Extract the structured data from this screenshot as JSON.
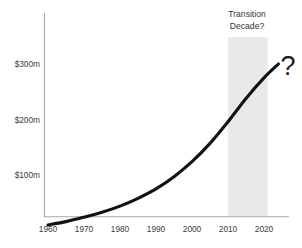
{
  "chart_data": {
    "type": "line",
    "title": "",
    "subtitle": "",
    "xlabel": "",
    "ylabel": "",
    "grid": false,
    "legend": "none",
    "x": [
      1960,
      1965,
      1970,
      1975,
      1980,
      1985,
      1990,
      1995,
      2000,
      2005,
      2010,
      2015,
      2020,
      2024
    ],
    "xlim": [
      1960,
      2025
    ],
    "ylim": [
      0,
      340
    ],
    "xticks": [
      "1960",
      "1970",
      "1980",
      "1990",
      "2000",
      "2010",
      "2020"
    ],
    "xtick_values": [
      1960,
      1970,
      1980,
      1990,
      2000,
      2010,
      2020
    ],
    "yticks": [
      "$100m",
      "$200m",
      "$300m"
    ],
    "ytick_values": [
      100,
      200,
      300
    ],
    "series": [
      {
        "name": "",
        "color": "#111111",
        "values": [
          10,
          16,
          24,
          33,
          44,
          58,
          75,
          97,
          124,
          157,
          196,
          238,
          275,
          300
        ]
      }
    ],
    "annotations": [
      {
        "name": "transition-decade",
        "line1": "Transition",
        "line2": "Decade?",
        "span_start": 2010,
        "span_end": 2021,
        "band_color": "#e9e9e9"
      },
      {
        "name": "uncertainty-marker",
        "text": "?",
        "x": 2025,
        "y": 305
      }
    ]
  },
  "axes": {
    "axis_color": "#a8a8a8",
    "y_label_0": "$300m",
    "y_label_1": "$200m",
    "y_label_2": "$100m",
    "x_label_0": "1960",
    "x_label_1": "1970",
    "x_label_2": "1980",
    "x_label_3": "1990",
    "x_label_4": "2000",
    "x_label_5": "2010",
    "x_label_6": "2020"
  },
  "annotation": {
    "line1": "Transition",
    "line2": "Decade?",
    "question_mark": "?"
  }
}
